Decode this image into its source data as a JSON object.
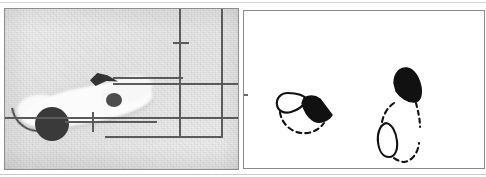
{
  "figure": {
    "panel_count": 2,
    "background_color": "#ffffff"
  },
  "left_panel": {
    "name": "photograph-panel",
    "type": "grayscale-photograph",
    "caption": "",
    "background_color": "#eeeeee",
    "border_color": "#8d8d8d",
    "subject_label": "pale elongated specimen",
    "features": [
      {
        "id": "specimen-body",
        "label": "pale elongated specimen body",
        "color": "#fbfbfb"
      },
      {
        "id": "dark-round-blob",
        "label": "dark round mass",
        "color": "#3a3a3a"
      },
      {
        "id": "dark-wedge",
        "label": "dark wedge marking",
        "color": "#333333"
      },
      {
        "id": "small-dark-blob",
        "label": "small dark nodule",
        "color": "#4d4d4d"
      },
      {
        "id": "whisker-curve",
        "label": "thin curved filament",
        "color": "#4a4a4a"
      }
    ],
    "overlay": {
      "label": "ruled overlay lines",
      "line_color": "#5b5b5b",
      "vertical_lines": 2,
      "horizontal_lines": 3,
      "markers": [
        {
          "id": "tick-mark",
          "label": "tick mark on vertical rule"
        },
        {
          "id": "cross-marker",
          "label": "cross marker with leader line"
        },
        {
          "id": "leader-line",
          "label": "leader line to wedge"
        }
      ]
    }
  },
  "right_panel": {
    "name": "line-drawing-panel",
    "type": "line-drawing",
    "caption": "",
    "background_color": "#ffffff",
    "border_color": "#8a8a8a",
    "ink_color": "#000000",
    "drawings": [
      {
        "id": "drawing-left",
        "label": "dashed circular outline with solid black wedge and open loop",
        "elements": [
          {
            "id": "dashed-circle",
            "label": "dashed circular contour",
            "style": "dashed"
          },
          {
            "id": "open-loop",
            "label": "open loop outline",
            "style": "solid-outline"
          },
          {
            "id": "black-wedge",
            "label": "solid black wedge",
            "style": "filled"
          }
        ]
      },
      {
        "id": "drawing-right",
        "label": "dashed arc with solid black blob and small outlined oval",
        "elements": [
          {
            "id": "dashed-arc",
            "label": "dashed arc contour",
            "style": "dashed"
          },
          {
            "id": "black-blob",
            "label": "solid black blob",
            "style": "filled"
          },
          {
            "id": "outlined-oval",
            "label": "small outlined oval",
            "style": "solid-outline"
          }
        ]
      }
    ]
  }
}
